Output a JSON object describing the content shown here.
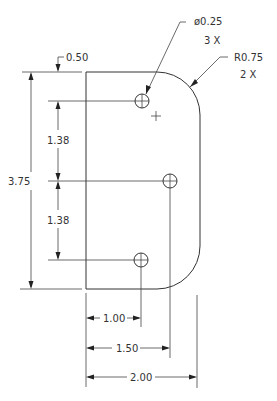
{
  "drawing": {
    "type": "mechanical part drawing",
    "units": "inches",
    "stroke_color": "#333333",
    "background_color": "#ffffff"
  },
  "callouts": {
    "hole": {
      "label": "ø0.25",
      "qty": "3 X"
    },
    "radius": {
      "label": "R0.75",
      "qty": "2 X"
    }
  },
  "dimensions": {
    "top_offset": "0.50",
    "overall_height": "3.75",
    "hole_spacing_upper": "1.38",
    "hole_spacing_lower": "1.38",
    "hole_x_1": "1.00",
    "hole_x_2": "1.50",
    "overall_width": "2.00"
  }
}
